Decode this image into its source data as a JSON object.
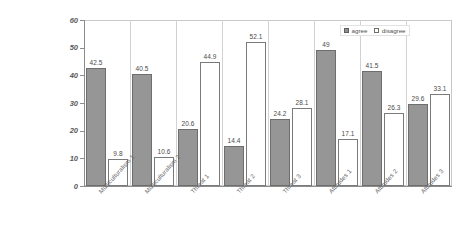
{
  "chart_data": {
    "type": "bar",
    "title": "",
    "subtitle": "",
    "xlabel": "",
    "ylabel": "",
    "ylim": [
      0,
      60
    ],
    "yticks": [
      0,
      10,
      20,
      30,
      40,
      50,
      60
    ],
    "ytick_labels": [
      "0",
      "10",
      "20",
      "30",
      "40",
      "50",
      "60"
    ],
    "grid": false,
    "legend_position": "top-right",
    "categories": [
      "Multiculturalism 1",
      "Multiculturalism 2",
      "Threat 1",
      "Threat 2",
      "Threat 3",
      "Attitudes 1",
      "Attitudes 2",
      "Attitudes 3"
    ],
    "series": [
      {
        "name": "agree",
        "color": "#969696",
        "values": [
          42.5,
          40.5,
          20.6,
          14.4,
          24.2,
          49,
          41.5,
          29.6
        ],
        "value_labels": [
          "42.5",
          "40.5",
          "20.6",
          "14.4",
          "24.2",
          "49",
          "41.5",
          "29.6"
        ]
      },
      {
        "name": "disagree",
        "color": "#ffffff",
        "values": [
          9.8,
          10.6,
          44.9,
          52.1,
          28.1,
          17.1,
          26.3,
          33.1
        ],
        "value_labels": [
          "9.8",
          "10.6",
          "44.9",
          "52.1",
          "28.1",
          "17.1",
          "26.3",
          "33.1"
        ]
      }
    ]
  },
  "legend": {
    "items": [
      {
        "label": "agree",
        "swatch": "filled-square-gray"
      },
      {
        "label": "disagree",
        "swatch": "outline-square-white"
      }
    ]
  }
}
